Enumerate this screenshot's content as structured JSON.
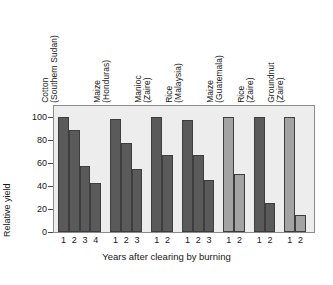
{
  "chart_data": {
    "type": "bar",
    "title": "",
    "xlabel": "Years after clearing by burning",
    "ylabel": "Relative yield",
    "ylim": [
      0,
      110
    ],
    "yticks": [
      0,
      20,
      40,
      60,
      80,
      100
    ],
    "grid": false,
    "legend": "none",
    "x_tick_label_meaning": "Years after clearing by burning",
    "colors": {
      "bar_dark": "#5a5a5a",
      "bar_light": "#a3a3a3",
      "bar_edge": "#3d3d3d",
      "plot_background": "#ededed",
      "frame": "#8c8c8c",
      "text": "#161616"
    },
    "groups": [
      {
        "crop": "Cotton",
        "place": "(Southern Sudan)",
        "shade": "dark",
        "categories": [
          "1",
          "2",
          "3",
          "4"
        ],
        "values": [
          100,
          89,
          58,
          43
        ]
      },
      {
        "crop": "Maize",
        "place": "(Honduras)",
        "shade": "dark",
        "categories": [
          "1",
          "2",
          "3"
        ],
        "values": [
          99,
          78,
          55
        ]
      },
      {
        "crop": "Manioc",
        "place": "(Zaire)",
        "shade": "dark",
        "categories": [
          "1",
          "2"
        ],
        "values": [
          100,
          67
        ]
      },
      {
        "crop": "Rice",
        "place": "(Malaysia)",
        "shade": "dark",
        "categories": [
          "1",
          "2",
          "3"
        ],
        "values": [
          98,
          67,
          45
        ]
      },
      {
        "crop": "Maize",
        "place": "(Guatemala)",
        "shade": "light",
        "categories": [
          "1",
          "2"
        ],
        "values": [
          100,
          51
        ]
      },
      {
        "crop": "Rice",
        "place": "(Zaire)",
        "shade": "dark",
        "categories": [
          "1",
          "2"
        ],
        "values": [
          100,
          25
        ]
      },
      {
        "crop": "Groundnut",
        "place": "(Zaire)",
        "shade": "light",
        "categories": [
          "1",
          "2"
        ],
        "values": [
          100,
          15
        ]
      }
    ]
  }
}
